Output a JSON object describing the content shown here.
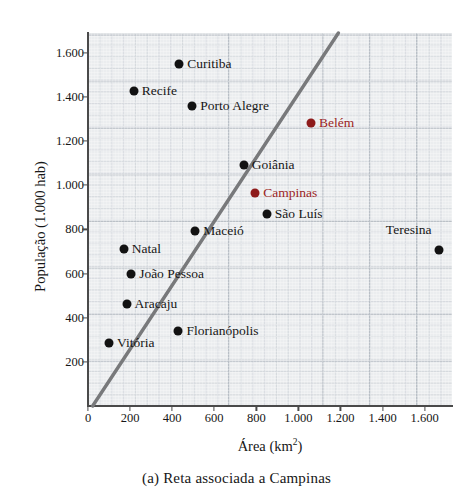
{
  "figure": {
    "caption": "(a) Reta associada a Campinas",
    "xlabel_text": "Área (km",
    "xlabel_sup": "2",
    "xlabel_tail": ")",
    "ylabel": "População (1.000 hab)",
    "accent_color": "#9c1f1f",
    "point_color": "#121212",
    "line_color": "#78797b",
    "panel_color": "#ebedef"
  },
  "chart_data": {
    "type": "scatter",
    "title": "(a) Reta associada a Campinas",
    "xlabel": "Área (km2)",
    "ylabel": "População (1.000 hab)",
    "xlim": [
      0,
      1730
    ],
    "ylim": [
      0,
      1690
    ],
    "grid": true,
    "legend": "none",
    "xticks": [
      "0",
      "200",
      "400",
      "600",
      "800",
      "1.000",
      "1.200",
      "1.400",
      "1.600"
    ],
    "xtick_values": [
      0,
      200,
      400,
      600,
      800,
      1000,
      1200,
      1400,
      1600
    ],
    "yticks": [
      "200",
      "400",
      "600",
      "800",
      "1.000",
      "1.200",
      "1.400",
      "1.600"
    ],
    "ytick_values": [
      200,
      400,
      600,
      800,
      1000,
      1200,
      1400,
      1600
    ],
    "points": [
      {
        "name": "Curitiba",
        "x": 434,
        "y": 1548,
        "highlight": false,
        "label_side": "right"
      },
      {
        "name": "Recife",
        "x": 218,
        "y": 1425,
        "highlight": false,
        "label_side": "right"
      },
      {
        "name": "Porto Alegre",
        "x": 496,
        "y": 1360,
        "highlight": false,
        "label_side": "right"
      },
      {
        "name": "Belém",
        "x": 1060,
        "y": 1280,
        "highlight": true,
        "label_side": "right"
      },
      {
        "name": "Goiânia",
        "x": 740,
        "y": 1090,
        "highlight": false,
        "label_side": "right"
      },
      {
        "name": "Campinas",
        "x": 795,
        "y": 965,
        "highlight": true,
        "label_side": "right"
      },
      {
        "name": "São Luís",
        "x": 850,
        "y": 870,
        "highlight": false,
        "label_side": "right"
      },
      {
        "name": "Maceió",
        "x": 510,
        "y": 795,
        "highlight": false,
        "label_side": "right"
      },
      {
        "name": "Natal",
        "x": 170,
        "y": 710,
        "highlight": false,
        "label_side": "right"
      },
      {
        "name": "Teresina",
        "x": 1670,
        "y": 705,
        "highlight": false,
        "label_side": "left"
      },
      {
        "name": "João Pessoa",
        "x": 205,
        "y": 600,
        "highlight": false,
        "label_side": "right"
      },
      {
        "name": "Aracaju",
        "x": 183,
        "y": 462,
        "highlight": false,
        "label_side": "right"
      },
      {
        "name": "Florianópolis",
        "x": 430,
        "y": 338,
        "highlight": false,
        "label_side": "right"
      },
      {
        "name": "Vitória",
        "x": 100,
        "y": 285,
        "highlight": false,
        "label_side": "right"
      }
    ],
    "fit_line": {
      "label": "Reta associada a Campinas",
      "x_start": 22,
      "y_start": 0,
      "x_end": 1190,
      "y_end": 1690
    }
  }
}
